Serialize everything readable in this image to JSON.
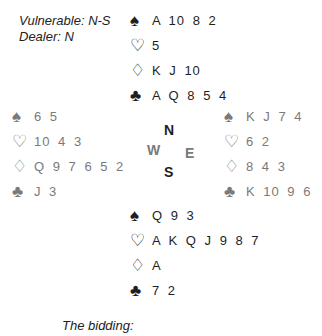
{
  "info": {
    "vulnerable": "Vulnerable: N-S",
    "dealer": "Dealer: N"
  },
  "suits": {
    "spades": "♠",
    "hearts": "♡",
    "diamonds": "♢",
    "clubs": "♣"
  },
  "hands": {
    "north": {
      "spades": "A 10 8 2",
      "hearts": "5",
      "diamonds": "K J 10",
      "clubs": "A Q 8 5 4"
    },
    "west": {
      "spades": "6 5",
      "hearts": "10 4 3",
      "diamonds": "Q 9 7 6 5 2",
      "clubs": "J 3"
    },
    "east": {
      "spades": "K J 7 4",
      "hearts": "6 2",
      "diamonds": "8 4 3",
      "clubs": "K 10 9 6"
    },
    "south": {
      "spades": "Q 9 3",
      "hearts": "A K Q J 9 8 7",
      "diamonds": "A",
      "clubs": "7 2"
    }
  },
  "compass": {
    "n": "N",
    "w": "W",
    "e": "E",
    "s": "S"
  },
  "bidding_label": "The bidding:",
  "colors": {
    "dark_text": "#1e1e1e",
    "grey_text": "#7a7a7a"
  }
}
